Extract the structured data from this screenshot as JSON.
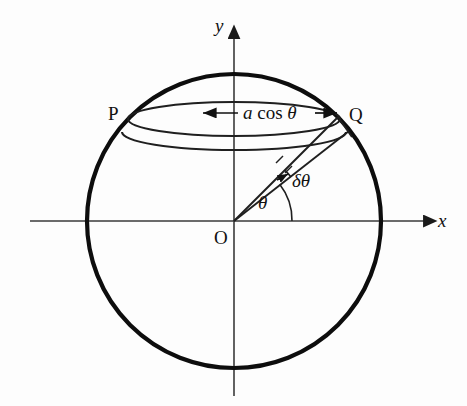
{
  "figure": {
    "type": "geometry-diagram",
    "colors": {
      "stroke_circle": "#0d0d0d",
      "stroke_thin": "#2a2a2a",
      "stroke_axis": "#3a3a3a",
      "background": "#fdfdfd",
      "text": "#111111"
    },
    "axes": {
      "x_label": "x",
      "y_label": "y",
      "origin_label": "O",
      "x_axis_start_px": 30,
      "x_axis_end_px": 432,
      "y_axis_top_px": 30,
      "y_axis_bottom_px": 396,
      "origin_px": [
        234,
        221
      ]
    },
    "circle": {
      "center_px": [
        234,
        221
      ],
      "radius_px": 147,
      "stroke_width_px": 4,
      "meaning": "great circle of sphere radius a"
    },
    "points": [
      {
        "id": "P",
        "label": "P",
        "px": [
          128,
          117
        ],
        "label_px": [
          109,
          104
        ]
      },
      {
        "id": "Q",
        "label": "Q",
        "px": [
          338,
          117
        ],
        "label_px": [
          349,
          104
        ]
      },
      {
        "id": "O",
        "label": "O",
        "px": [
          234,
          221
        ],
        "label_px": [
          215,
          226
        ]
      }
    ],
    "latitude_ellipse": {
      "center_px": [
        234,
        119
      ],
      "rx_px": 106,
      "ry_px": 17,
      "meaning": "circle of latitude through P and Q, radius a cos theta"
    },
    "lower_ellipse": {
      "center_px": [
        234,
        134
      ],
      "rx_px": 112,
      "ry_px": 18,
      "meaning": "neighbouring circle of latitude at theta minus delta theta"
    },
    "radii": [
      {
        "id": "radius-to-Q",
        "from_px": [
          234,
          221
        ],
        "to_px": [
          338,
          117
        ],
        "angle_deg": 45
      },
      {
        "id": "radius-lower",
        "from_px": [
          234,
          221
        ],
        "to_px": [
          348,
          131
        ],
        "angle_deg": 38
      }
    ],
    "annotations": {
      "radius_measure": {
        "text_parts": {
          "a": "a",
          "cos": "cos",
          "theta": "θ"
        },
        "text_full": "a cos θ",
        "label_px": [
          249,
          106
        ],
        "arrow_left_px": [
          204,
          113
        ],
        "arrow_right_px": [
          336,
          113
        ],
        "style": "double-headed-arrow"
      },
      "delta_theta": {
        "text": "δθ",
        "label_px": [
          276,
          180
        ],
        "arc_center_px": [
          234,
          221
        ],
        "arc_radius_px": 72,
        "from_deg": 38,
        "to_deg": 45
      },
      "theta": {
        "text": "θ",
        "label_px": [
          256,
          200
        ],
        "arc_center_px": [
          234,
          221
        ],
        "arc_radius_px": 58,
        "from_deg": 0,
        "to_deg": 38
      }
    }
  }
}
